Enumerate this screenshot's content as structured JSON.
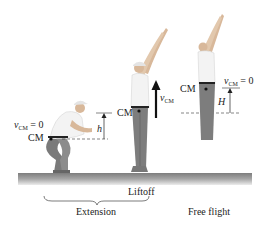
{
  "figure": {
    "stages": [
      {
        "name": "crouch",
        "v_label_symbol": "v",
        "v_label_sub": "CM",
        "v_label_eq": " = 0",
        "cm_label": "CM",
        "height_label": "h"
      },
      {
        "name": "liftoff",
        "cm_label": "CM",
        "v_label_symbol": "v",
        "v_label_sub": "CM",
        "caption": "Liftoff"
      },
      {
        "name": "peak",
        "cm_label": "CM",
        "v_label_symbol": "v",
        "v_label_sub": "CM",
        "v_label_eq": " = 0",
        "height_label": "H"
      }
    ],
    "phases": {
      "extension": "Extension",
      "free_flight": "Free flight"
    },
    "colors": {
      "ground_top": "#8a8a8a",
      "ground_bottom": "#e0e0e0",
      "arrow": "#111111",
      "dashed": "#333333",
      "skin": "#d8b89a",
      "shirt": "#f2f2f2",
      "pants": "#7a7a7a"
    }
  }
}
